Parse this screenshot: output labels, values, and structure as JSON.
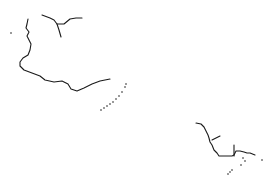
{
  "map": {
    "width": 276,
    "height": 183,
    "background": "#ffffff",
    "stroke_color": "#1a1a1a",
    "features": [
      {
        "name": "northwest-coastline",
        "type": "line",
        "points": [
          [
            28,
            19
          ],
          [
            27,
            24
          ],
          [
            26,
            28
          ],
          [
            29,
            32
          ],
          [
            27,
            36
          ],
          [
            29,
            40
          ],
          [
            31,
            44
          ],
          [
            30,
            50
          ],
          [
            28,
            55
          ],
          [
            23,
            58
          ],
          [
            20,
            62
          ],
          [
            20,
            66
          ],
          [
            24,
            70
          ],
          [
            32,
            73
          ],
          [
            40,
            76
          ],
          [
            45,
            80
          ],
          [
            54,
            82
          ],
          [
            62,
            81
          ],
          [
            68,
            84
          ],
          [
            71,
            89
          ],
          [
            77,
            91
          ],
          [
            84,
            88
          ],
          [
            92,
            84
          ],
          [
            100,
            81
          ],
          [
            110,
            79
          ]
        ]
      },
      {
        "name": "north-river-system",
        "type": "line",
        "points": [
          [
            42,
            15
          ],
          [
            50,
            18
          ],
          [
            54,
            20
          ],
          [
            57,
            24
          ],
          [
            64,
            24
          ],
          [
            70,
            19
          ],
          [
            76,
            18
          ],
          [
            82,
            18
          ]
        ]
      },
      {
        "name": "north-river-branch",
        "type": "line",
        "points": [
          [
            57,
            24
          ],
          [
            59,
            30
          ],
          [
            61,
            37
          ]
        ]
      },
      {
        "name": "island-chain",
        "type": "dots",
        "points": [
          [
            101,
            110
          ],
          [
            104,
            108
          ],
          [
            107,
            106
          ],
          [
            110,
            104
          ],
          [
            113,
            102
          ],
          [
            116,
            99
          ],
          [
            119,
            96
          ],
          [
            122,
            92
          ],
          [
            125,
            87
          ],
          [
            126,
            84
          ]
        ]
      },
      {
        "name": "southeast-coastline",
        "type": "line",
        "points": [
          [
            196,
            123
          ],
          [
            201,
            124
          ],
          [
            204,
            127
          ],
          [
            206,
            131
          ],
          [
            208,
            135
          ],
          [
            209,
            138
          ],
          [
            210,
            142
          ],
          [
            212,
            145
          ],
          [
            214,
            150
          ],
          [
            217,
            153
          ],
          [
            219,
            156
          ],
          [
            223,
            156
          ],
          [
            228,
            156
          ],
          [
            232,
            156
          ],
          [
            234,
            155
          ],
          [
            236,
            151
          ],
          [
            240,
            151
          ],
          [
            244,
            152
          ],
          [
            247,
            153
          ],
          [
            250,
            153
          ],
          [
            255,
            155
          ]
        ]
      },
      {
        "name": "southeast-inlet",
        "type": "line",
        "points": [
          [
            212,
            140
          ],
          [
            216,
            138
          ],
          [
            220,
            136
          ]
        ]
      },
      {
        "name": "southeast-vertical-stream",
        "type": "line",
        "points": [
          [
            234,
            145
          ],
          [
            234,
            150
          ],
          [
            234,
            156
          ]
        ]
      },
      {
        "name": "southeast-islets",
        "type": "dots",
        "points": [
          [
            243,
            158
          ],
          [
            245,
            161
          ],
          [
            241,
            165
          ],
          [
            232,
            170
          ],
          [
            230,
            172
          ],
          [
            228,
            174
          ],
          [
            262,
            160
          ]
        ]
      },
      {
        "name": "isolated-dot",
        "type": "dots",
        "points": [
          [
            11,
            33
          ]
        ]
      }
    ]
  }
}
